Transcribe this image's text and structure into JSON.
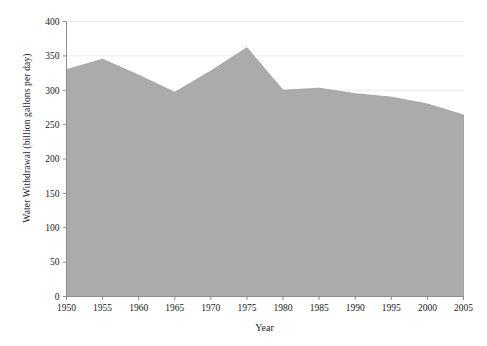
{
  "chart_data": {
    "type": "area",
    "title": "",
    "xlabel": "Year",
    "ylabel": "Water Withdrawal (billion gallons per day)",
    "x": [
      1950,
      1955,
      1960,
      1965,
      1970,
      1975,
      1980,
      1985,
      1990,
      1995,
      2000,
      2005
    ],
    "values": [
      330,
      345,
      322,
      297,
      328,
      362,
      300,
      303,
      295,
      290,
      280,
      264
    ],
    "series": [
      {
        "name": "Water Withdrawal",
        "values": [
          330,
          345,
          322,
          297,
          328,
          362,
          300,
          303,
          295,
          290,
          280,
          264
        ]
      }
    ],
    "xlim": [
      1950,
      2005
    ],
    "ylim": [
      0,
      400
    ],
    "xticks": [
      1950,
      1955,
      1960,
      1965,
      1970,
      1975,
      1980,
      1985,
      1990,
      1995,
      2000,
      2005
    ],
    "yticks": [
      0,
      50,
      100,
      150,
      200,
      250,
      300,
      350,
      400
    ],
    "xtick_labels": [
      "1950",
      "1955",
      "1960",
      "1965",
      "1970",
      "1975",
      "1980",
      "1985",
      "1990",
      "1995",
      "2000",
      "2005"
    ],
    "ytick_labels": [
      "0",
      "50",
      "100",
      "150",
      "200",
      "250",
      "300",
      "350",
      "400"
    ],
    "grid": true,
    "grid_axis": "y",
    "legend": false,
    "legend_position": "none",
    "fill_color": "#ababab",
    "line_color": "#9a9a9a",
    "axis_color": "#8c8c8c",
    "grid_color": "#ebebeb",
    "background": "#ffffff",
    "annotations": []
  }
}
